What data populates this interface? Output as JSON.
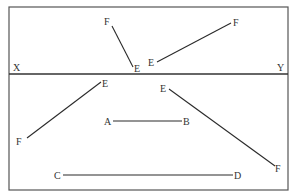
{
  "diagram": {
    "type": "orthographic-projection-lines",
    "colors": {
      "line": "#2a2a2a",
      "frame": "#555555",
      "text": "#333333",
      "background": "#ffffff"
    },
    "frame": {
      "x1": 9,
      "y1": 7,
      "x2": 288,
      "y2": 190
    },
    "ground_line": {
      "y": 74,
      "left_label": "X",
      "right_label": "Y"
    },
    "segments": [
      {
        "id": "top-ef-1",
        "start_label": "F",
        "end_label": "E",
        "x1": 112,
        "y1": 26,
        "x2": 133,
        "y2": 67,
        "start_label_pos": [
          104,
          25
        ],
        "end_label_pos": [
          134,
          72
        ]
      },
      {
        "id": "top-ef-2",
        "start_label": "E",
        "end_label": "F",
        "x1": 157,
        "y1": 62,
        "x2": 231,
        "y2": 23,
        "start_label_pos": [
          148,
          66
        ],
        "end_label_pos": [
          233,
          26
        ]
      },
      {
        "id": "bottom-ef-1",
        "start_label": "E",
        "end_label": "F",
        "x1": 101,
        "y1": 82,
        "x2": 27,
        "y2": 138,
        "start_label_pos": [
          102,
          87
        ],
        "end_label_pos": [
          16,
          145
        ]
      },
      {
        "id": "bottom-ef-2",
        "start_label": "E",
        "end_label": "F",
        "x1": 169,
        "y1": 89,
        "x2": 275,
        "y2": 166,
        "start_label_pos": [
          160,
          92
        ],
        "end_label_pos": [
          275,
          172
        ]
      },
      {
        "id": "ab",
        "start_label": "A",
        "end_label": "B",
        "x1": 113,
        "y1": 121,
        "x2": 182,
        "y2": 121,
        "start_label_pos": [
          104,
          125
        ],
        "end_label_pos": [
          183,
          125
        ]
      },
      {
        "id": "cd",
        "start_label": "C",
        "end_label": "D",
        "x1": 63,
        "y1": 175,
        "x2": 233,
        "y2": 175,
        "start_label_pos": [
          54,
          179
        ],
        "end_label_pos": [
          234,
          179
        ]
      }
    ]
  }
}
